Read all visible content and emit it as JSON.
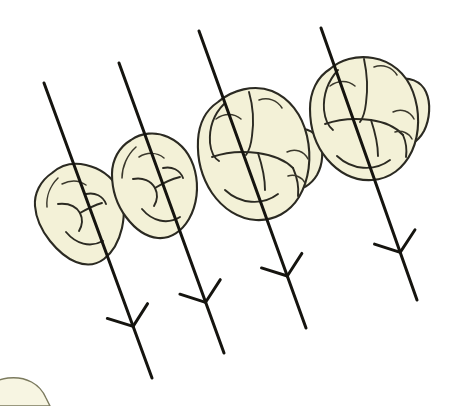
{
  "figure": {
    "background_color": "#ffffff",
    "canvas": {
      "width": 450,
      "height": 406
    }
  },
  "style": {
    "enamel_fill": "#f3f1d7",
    "enamel_fill_light": "#f7f5e2",
    "outline_color": "#2b2a22",
    "groove_color": "#3a382c",
    "axis_color": "#15140f",
    "axis_stroke_width": 3.0,
    "outline_stroke_width": 2.1
  },
  "teeth": [
    {
      "id": "tooth-1",
      "name": "first-tooth",
      "label": "Tooth 1",
      "position": "left",
      "relative_size": "smallest",
      "cusp_count": 2,
      "fill": "#f3f1d7"
    },
    {
      "id": "tooth-2",
      "name": "second-tooth",
      "label": "Tooth 2",
      "position": "left-center",
      "relative_size": "small",
      "cusp_count": 2,
      "fill": "#f3f1d7"
    },
    {
      "id": "tooth-3",
      "name": "third-tooth",
      "label": "Tooth 3",
      "position": "right-center",
      "relative_size": "large",
      "cusp_count": 5,
      "fill": "#f3f1d7"
    },
    {
      "id": "tooth-4",
      "name": "fourth-tooth",
      "label": "Tooth 4",
      "position": "right",
      "relative_size": "largest",
      "cusp_count": 5,
      "fill": "#f3f1d7"
    }
  ],
  "axes": [
    {
      "id": "axis-1",
      "name": "long-axis-arrow-1",
      "label": "Long axis 1",
      "start": {
        "x": 44,
        "y": 83
      },
      "end": {
        "x": 152,
        "y": 378
      },
      "arrowhead": "feathered-y",
      "direction": "down-right"
    },
    {
      "id": "axis-2",
      "name": "long-axis-arrow-2",
      "label": "Long axis 2",
      "start": {
        "x": 119,
        "y": 63
      },
      "end": {
        "x": 224,
        "y": 353
      },
      "arrowhead": "feathered-y",
      "direction": "down-right"
    },
    {
      "id": "axis-3",
      "name": "long-axis-arrow-3",
      "label": "Long axis 3",
      "start": {
        "x": 199,
        "y": 31
      },
      "end": {
        "x": 306,
        "y": 328
      },
      "arrowhead": "feathered-y",
      "direction": "down-right"
    },
    {
      "id": "axis-4",
      "name": "long-axis-arrow-4",
      "label": "Long axis 4",
      "start": {
        "x": 321,
        "y": 28
      },
      "end": {
        "x": 417,
        "y": 300
      },
      "arrowhead": "feathered-y",
      "direction": "down-right"
    }
  ],
  "corner_fragment": {
    "name": "cropped-tooth-fragment",
    "label": "Partially cropped tooth at lower-left edge",
    "fill": "#f7f5e2",
    "stroke": "#7b7a5e"
  }
}
